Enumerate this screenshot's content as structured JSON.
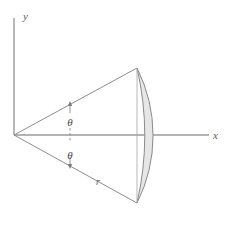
{
  "figure": {
    "background_color": "#ffffff",
    "line_color": "#8c8c8c",
    "axis_color": "#9a9a9a",
    "cap_fill_color": "#e6e6e6",
    "cap_stroke_color": "#8a8a8a",
    "text_color": "#5a5a5a"
  },
  "axes": {
    "x_label": "x",
    "y_label": "y",
    "origin": {
      "x": 14,
      "y": 135
    },
    "x_end": {
      "x": 214,
      "y": 135
    },
    "y_end": {
      "x": 14,
      "y": 18
    }
  },
  "angles": {
    "upper_label": "θ",
    "lower_label": "θ",
    "upper_label_pos": {
      "x": 74,
      "y": 122
    },
    "lower_label_pos": {
      "x": 74,
      "y": 155
    }
  },
  "radius": {
    "label": "r",
    "label_pos": {
      "x": 98,
      "y": 182
    }
  },
  "geometry": {
    "apex": {
      "x": 14,
      "y": 135
    },
    "upper_rim": {
      "x": 137,
      "y": 68
    },
    "lower_rim": {
      "x": 137,
      "y": 203
    },
    "cap_apex": {
      "x": 162,
      "y": 135
    }
  }
}
